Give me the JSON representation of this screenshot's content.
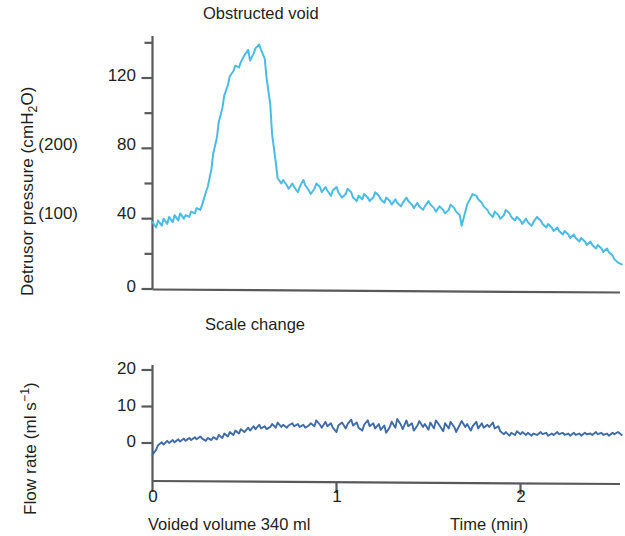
{
  "figure": {
    "background": "#ffffff",
    "width": 625,
    "height": 536
  },
  "panels": {
    "pressure": {
      "title": "Obstructed void",
      "y_axis_label_main": "Detrusor pressure (cmH",
      "y_axis_label_sub": "2",
      "y_axis_label_tail": "O)",
      "y_ticks": [
        "0",
        "40",
        "80",
        "120"
      ],
      "secondary_scale_labels": [
        "(100)",
        "(200)"
      ],
      "trace_color": "#4bbce4",
      "axis_color": "#58595b"
    },
    "flow": {
      "title": "Scale change",
      "y_axis_label_main": "Flow rate (ml s",
      "y_axis_label_sup": "−1",
      "y_axis_label_tail": ")",
      "y_ticks": [
        "0",
        "10",
        "20"
      ],
      "trace_color": "#3f6ca8",
      "axis_color": "#58595b"
    }
  },
  "x_axis": {
    "ticks": [
      "0",
      "1",
      "2"
    ],
    "label": "Time (min)",
    "voided_volume": "Voided volume 340 ml"
  },
  "chart_data": {
    "type": "line",
    "title": "Obstructed void",
    "xlabel": "Time (min)",
    "xlim": [
      0,
      2.55
    ],
    "annotations": [
      "Obstructed void",
      "Scale change",
      "Voided volume 340 ml"
    ],
    "grid": false,
    "legend": "none",
    "panels": [
      {
        "name": "Detrusor pressure",
        "ylabel": "Detrusor pressure (cmH2O)",
        "ylim": [
          0,
          140
        ],
        "yticks": [
          0,
          40,
          80,
          120
        ],
        "secondary_yticks_labels": {
          "40": "(100)",
          "80": "(200)"
        },
        "color": "#4bbce4",
        "x": [
          0.0,
          0.02,
          0.03,
          0.05,
          0.06,
          0.08,
          0.09,
          0.11,
          0.12,
          0.14,
          0.15,
          0.17,
          0.18,
          0.2,
          0.21,
          0.23,
          0.24,
          0.26,
          0.27,
          0.29,
          0.3,
          0.32,
          0.33,
          0.35,
          0.36,
          0.38,
          0.39,
          0.41,
          0.42,
          0.44,
          0.45,
          0.47,
          0.48,
          0.5,
          0.52,
          0.53,
          0.55,
          0.56,
          0.58,
          0.59,
          0.61,
          0.62,
          0.64,
          0.65,
          0.67,
          0.68,
          0.7,
          0.71,
          0.73,
          0.74,
          0.76,
          0.77,
          0.79,
          0.8,
          0.82,
          0.83,
          0.85,
          0.86,
          0.88,
          0.89,
          0.91,
          0.92,
          0.94,
          0.95,
          0.97,
          0.98,
          1.0,
          1.01,
          1.03,
          1.05,
          1.06,
          1.08,
          1.09,
          1.11,
          1.12,
          1.14,
          1.15,
          1.17,
          1.18,
          1.2,
          1.21,
          1.23,
          1.24,
          1.26,
          1.27,
          1.29,
          1.3,
          1.32,
          1.33,
          1.35,
          1.36,
          1.38,
          1.39,
          1.41,
          1.42,
          1.44,
          1.45,
          1.47,
          1.48,
          1.5,
          1.51,
          1.53,
          1.54,
          1.56,
          1.58,
          1.59,
          1.61,
          1.62,
          1.64,
          1.65,
          1.67,
          1.68,
          1.7,
          1.71,
          1.73,
          1.74,
          1.76,
          1.77,
          1.79,
          1.8,
          1.82,
          1.83,
          1.85,
          1.86,
          1.88,
          1.89,
          1.91,
          1.92,
          1.94,
          1.95,
          1.97,
          1.98,
          2.0,
          2.01,
          2.03,
          2.04,
          2.06,
          2.07,
          2.09,
          2.11,
          2.12,
          2.14,
          2.15,
          2.17,
          2.18,
          2.2,
          2.21,
          2.23,
          2.24,
          2.26,
          2.27,
          2.29,
          2.3,
          2.32,
          2.33,
          2.35,
          2.36,
          2.38,
          2.39,
          2.41,
          2.42,
          2.44,
          2.45,
          2.47,
          2.48,
          2.5,
          2.51,
          2.53,
          2.55
        ],
        "y": [
          38,
          35,
          39,
          36,
          40,
          37,
          41,
          38,
          42,
          39,
          43,
          40,
          42,
          41,
          44,
          43,
          46,
          45,
          48,
          55,
          58,
          68,
          77,
          86,
          95,
          103,
          110,
          116,
          121,
          124,
          127,
          126,
          129,
          133,
          136,
          130,
          134,
          137,
          139,
          136,
          131,
          120,
          105,
          88,
          72,
          63,
          60,
          62,
          59,
          57,
          60,
          58,
          55,
          58,
          62,
          59,
          56,
          54,
          57,
          60,
          58,
          55,
          58,
          56,
          53,
          56,
          58,
          55,
          52,
          54,
          57,
          55,
          52,
          50,
          53,
          51,
          54,
          52,
          50,
          52,
          55,
          53,
          51,
          49,
          52,
          50,
          48,
          51,
          49,
          47,
          49,
          52,
          50,
          48,
          46,
          49,
          47,
          45,
          47,
          50,
          48,
          46,
          44,
          47,
          45,
          43,
          45,
          48,
          46,
          44,
          42,
          36,
          44,
          48,
          52,
          54,
          53,
          51,
          49,
          47,
          45,
          43,
          41,
          44,
          42,
          40,
          42,
          45,
          43,
          41,
          39,
          41,
          39,
          37,
          40,
          38,
          36,
          38,
          41,
          39,
          37,
          35,
          37,
          35,
          33,
          35,
          33,
          31,
          33,
          31,
          29,
          31,
          29,
          27,
          29,
          27,
          25,
          27,
          25,
          23,
          25,
          23,
          21,
          23,
          21,
          19,
          17,
          15,
          14
        ]
      },
      {
        "name": "Flow rate",
        "ylabel": "Flow rate (ml s-1)",
        "ylim": [
          -10,
          20
        ],
        "yticks": [
          0,
          10,
          20
        ],
        "color": "#3f6ca8",
        "x": [
          0.0,
          0.02,
          0.03,
          0.05,
          0.06,
          0.08,
          0.09,
          0.11,
          0.12,
          0.14,
          0.15,
          0.17,
          0.18,
          0.2,
          0.21,
          0.23,
          0.24,
          0.26,
          0.27,
          0.29,
          0.3,
          0.32,
          0.33,
          0.35,
          0.36,
          0.38,
          0.39,
          0.41,
          0.42,
          0.44,
          0.45,
          0.47,
          0.48,
          0.5,
          0.52,
          0.53,
          0.55,
          0.56,
          0.58,
          0.59,
          0.61,
          0.62,
          0.64,
          0.65,
          0.67,
          0.68,
          0.7,
          0.71,
          0.73,
          0.74,
          0.76,
          0.77,
          0.79,
          0.8,
          0.82,
          0.83,
          0.85,
          0.86,
          0.88,
          0.89,
          0.91,
          0.92,
          0.94,
          0.95,
          0.97,
          0.98,
          1.0,
          1.01,
          1.03,
          1.05,
          1.06,
          1.08,
          1.09,
          1.11,
          1.12,
          1.14,
          1.15,
          1.17,
          1.18,
          1.2,
          1.21,
          1.23,
          1.24,
          1.26,
          1.27,
          1.29,
          1.3,
          1.32,
          1.33,
          1.35,
          1.36,
          1.38,
          1.39,
          1.41,
          1.42,
          1.44,
          1.45,
          1.47,
          1.48,
          1.5,
          1.51,
          1.53,
          1.54,
          1.56,
          1.58,
          1.59,
          1.61,
          1.62,
          1.64,
          1.65,
          1.67,
          1.68,
          1.7,
          1.71,
          1.73,
          1.74,
          1.76,
          1.77,
          1.79,
          1.8,
          1.82,
          1.83,
          1.85,
          1.86,
          1.88,
          1.89,
          1.91,
          1.92,
          1.94,
          1.95,
          1.97,
          1.98,
          2.0,
          2.01,
          2.03,
          2.04,
          2.06,
          2.07,
          2.09,
          2.11,
          2.12,
          2.14,
          2.15,
          2.17,
          2.18,
          2.2,
          2.21,
          2.23,
          2.24,
          2.26,
          2.27,
          2.29,
          2.3,
          2.32,
          2.33,
          2.35,
          2.36,
          2.38,
          2.39,
          2.41,
          2.42,
          2.44,
          2.45,
          2.47,
          2.48,
          2.5,
          2.51,
          2.53,
          2.55
        ],
        "y": [
          -3.2,
          -1.8,
          -0.6,
          0.2,
          -0.4,
          0.6,
          0.0,
          0.8,
          0.2,
          1.0,
          0.4,
          1.2,
          0.6,
          1.4,
          0.8,
          1.6,
          1.0,
          1.8,
          1.2,
          0.6,
          1.4,
          0.8,
          1.6,
          1.0,
          2.2,
          1.4,
          2.6,
          1.8,
          3.0,
          2.2,
          3.4,
          2.6,
          3.8,
          3.0,
          4.2,
          3.4,
          4.6,
          3.8,
          5.0,
          4.0,
          4.6,
          3.8,
          4.4,
          5.2,
          4.2,
          5.6,
          4.4,
          5.0,
          4.2,
          4.8,
          5.4,
          4.6,
          5.2,
          4.4,
          5.0,
          4.2,
          4.8,
          5.4,
          4.6,
          6.2,
          5.0,
          4.2,
          5.8,
          4.6,
          5.4,
          4.2,
          3.0,
          4.8,
          5.6,
          4.0,
          5.2,
          6.4,
          4.8,
          5.6,
          4.2,
          3.4,
          5.0,
          6.2,
          4.6,
          5.4,
          4.0,
          5.2,
          3.6,
          4.8,
          2.8,
          4.4,
          5.8,
          4.2,
          6.6,
          5.0,
          3.8,
          6.2,
          4.6,
          5.4,
          3.4,
          4.8,
          6.0,
          4.4,
          5.2,
          3.6,
          5.6,
          4.0,
          6.2,
          4.8,
          3.2,
          5.4,
          4.0,
          5.8,
          4.4,
          3.0,
          5.0,
          6.0,
          4.4,
          5.2,
          3.4,
          4.6,
          5.8,
          4.0,
          5.4,
          4.2,
          5.0,
          4.4,
          5.6,
          4.0,
          4.6,
          3.2,
          2.4,
          3.0,
          2.0,
          2.8,
          2.2,
          3.2,
          2.4,
          3.0,
          2.2,
          2.8,
          2.0,
          2.6,
          2.2,
          3.0,
          2.4,
          2.8,
          2.0,
          2.6,
          2.2,
          3.0,
          2.4,
          2.8,
          2.2,
          2.6,
          2.0,
          2.8,
          2.2,
          2.6,
          2.0,
          2.8,
          2.4,
          2.6,
          2.2,
          3.0,
          2.4,
          2.8,
          2.2,
          2.6,
          2.0,
          2.8,
          2.4,
          3.0,
          2.2
        ]
      }
    ]
  }
}
